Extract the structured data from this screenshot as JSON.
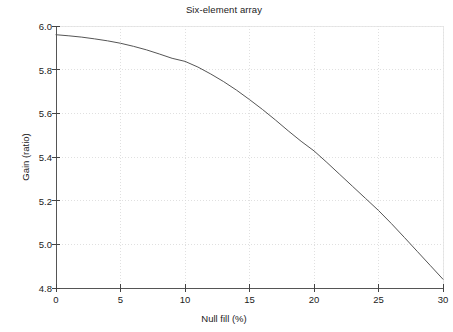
{
  "chart_data": {
    "type": "line",
    "title": "Six-element array",
    "xlabel": "Null fill (%)",
    "ylabel": "Gain (ratio)",
    "xlim": [
      0,
      30
    ],
    "ylim": [
      4.8,
      6.0
    ],
    "xticks": [
      "0",
      "5",
      "10",
      "15",
      "20",
      "25",
      "30"
    ],
    "xtick_values": [
      0,
      5,
      10,
      15,
      20,
      25,
      30
    ],
    "yticks": [
      "6.0",
      "5.8",
      "5.6",
      "5.4",
      "5.2",
      "5.0",
      "4.8"
    ],
    "ytick_values": [
      6.0,
      5.8,
      5.6,
      5.4,
      5.2,
      5.0,
      4.8
    ],
    "grid": true,
    "grid_style": "dotted",
    "legend": null,
    "series": [
      {
        "name": "Gain vs null fill",
        "color": "#555555",
        "x": [
          0,
          1,
          2,
          3,
          4,
          5,
          6,
          7,
          8,
          9,
          10,
          11,
          12,
          13,
          14,
          15,
          16,
          17,
          18,
          19,
          20,
          21,
          22,
          23,
          24,
          25,
          26,
          27,
          28,
          29,
          30
        ],
        "y": [
          5.96,
          5.955,
          5.949,
          5.941,
          5.932,
          5.921,
          5.907,
          5.891,
          5.872,
          5.852,
          5.838,
          5.812,
          5.78,
          5.745,
          5.706,
          5.663,
          5.618,
          5.57,
          5.52,
          5.472,
          5.428,
          5.375,
          5.32,
          5.265,
          5.21,
          5.155,
          5.095,
          5.032,
          4.968,
          4.904,
          4.84
        ]
      }
    ]
  },
  "axes": {
    "tick_color": "#444444",
    "grid_color": "#d8d8d8",
    "frame_color": "#555555",
    "background": "#ffffff"
  }
}
